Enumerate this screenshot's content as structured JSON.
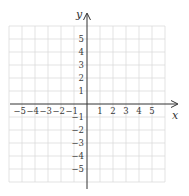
{
  "chart_data": {
    "type": "scatter",
    "title": "",
    "xlabel": "x",
    "ylabel": "y",
    "xlim": [
      -6,
      6
    ],
    "ylim": [
      -6,
      6
    ],
    "grid": true,
    "x_ticks": [
      "-5",
      "-4",
      "-3",
      "-2",
      "-1",
      "1",
      "2",
      "3",
      "4",
      "5"
    ],
    "y_ticks": [
      "5",
      "4",
      "3",
      "2",
      "1",
      "-1",
      "-2",
      "-3",
      "-4",
      "-5"
    ],
    "series": [],
    "colors": {
      "grid": "#dcdcdc",
      "axis": "#333333",
      "text": "#3a3a3a"
    }
  },
  "axes": {
    "x_label": "x",
    "y_label": "y"
  },
  "x_tick_labels": [
    "−5",
    "−4",
    "−3",
    "−2",
    "−1",
    "1",
    "2",
    "3",
    "4",
    "5"
  ],
  "y_tick_labels": [
    "5",
    "4",
    "3",
    "2",
    "1",
    "−1",
    "−2",
    "−3",
    "−4",
    "−5"
  ]
}
